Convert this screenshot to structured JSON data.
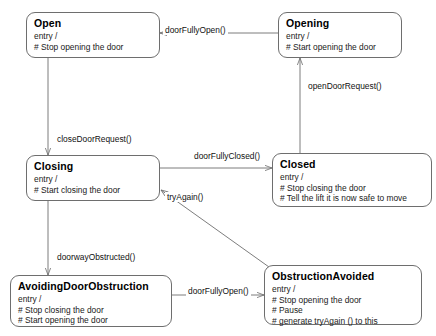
{
  "diagram": {
    "type": "uml-state-diagram",
    "stroke_color": "#6e6e6e",
    "text_color": "#000000",
    "background": "#ffffff"
  },
  "states": [
    {
      "id": "open",
      "name": "Open",
      "entry_label": "entry /",
      "actions": [
        "# Stop opening the door"
      ],
      "x": 26,
      "y": 12,
      "w": 134,
      "h": 46
    },
    {
      "id": "opening",
      "name": "Opening",
      "entry_label": "entry /",
      "actions": [
        "# Start opening the door"
      ],
      "x": 278,
      "y": 12,
      "w": 124,
      "h": 46
    },
    {
      "id": "closing",
      "name": "Closing",
      "entry_label": "entry /",
      "actions": [
        "# Start closing the door"
      ],
      "x": 26,
      "y": 155,
      "w": 134,
      "h": 46
    },
    {
      "id": "closed",
      "name": "Closed",
      "entry_label": "entry /",
      "actions": [
        "# Stop closing the door",
        "# Tell the lift it is now safe to move"
      ],
      "x": 272,
      "y": 153,
      "w": 160,
      "h": 54
    },
    {
      "id": "avoiding",
      "name": "AvoidingDoorObstruction",
      "entry_label": "entry /",
      "actions": [
        "# Stop closing the door",
        "# Start opening the door"
      ],
      "x": 10,
      "y": 275,
      "w": 162,
      "h": 52
    },
    {
      "id": "avoided",
      "name": "ObstructionAvoided",
      "entry_label": "entry /",
      "actions": [
        "# Stop opening the door",
        "# Pause",
        "# generate tryAgain () to this"
      ],
      "x": 264,
      "y": 265,
      "w": 158,
      "h": 60
    }
  ],
  "transitions": [
    {
      "id": "t-door-fully-open-top",
      "label": "doorFullyOpen()",
      "from": "opening",
      "to": "open",
      "label_x": 163,
      "label_y": 25
    },
    {
      "id": "t-open-door-request",
      "label": "openDoorRequest()",
      "from": "closed",
      "to": "opening",
      "label_x": 306,
      "label_y": 81
    },
    {
      "id": "t-close-door-request",
      "label": "closeDoorRequest()",
      "from": "open",
      "to": "closing",
      "label_x": 55,
      "label_y": 134
    },
    {
      "id": "t-door-fully-closed",
      "label": "doorFullyClosed()",
      "from": "closing",
      "to": "closed",
      "label_x": 192,
      "label_y": 151
    },
    {
      "id": "t-try-again",
      "label": "tryAgain()",
      "from": "avoided",
      "to": "closing",
      "label_x": 165,
      "label_y": 192
    },
    {
      "id": "t-doorway-obstructed",
      "label": "doorwayObstructed()",
      "from": "closing",
      "to": "avoiding",
      "label_x": 55,
      "label_y": 252
    },
    {
      "id": "t-door-fully-open-bottom",
      "label": "doorFullyOpen()",
      "from": "avoiding",
      "to": "avoided",
      "label_x": 186,
      "label_y": 286
    }
  ]
}
